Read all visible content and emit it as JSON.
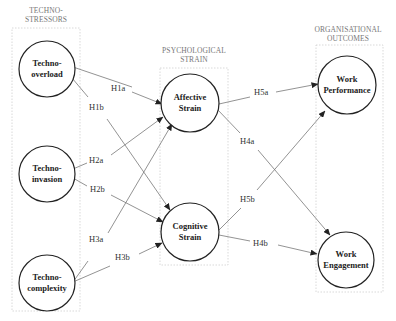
{
  "groups": [
    {
      "id": "stressors",
      "label_line1": "TECHNO-",
      "label_line2": "STRESSORS"
    },
    {
      "id": "strain",
      "label_line1": "PSYCHOLOGICAL",
      "label_line2": "STRAIN"
    },
    {
      "id": "outcomes",
      "label_line1": "ORGANISATIONAL",
      "label_line2": "OUTCOMES"
    }
  ],
  "nodes": [
    {
      "id": "overload",
      "line1": "Techno-",
      "line2": "overload"
    },
    {
      "id": "invasion",
      "line1": "Techno-",
      "line2": "invasion"
    },
    {
      "id": "complexity",
      "line1": "Techno-",
      "line2": "complexity"
    },
    {
      "id": "affective",
      "line1": "Affective",
      "line2": "Strain"
    },
    {
      "id": "cognitive",
      "line1": "Cognitive",
      "line2": "Strain"
    },
    {
      "id": "performance",
      "line1": "Work",
      "line2": "Performance"
    },
    {
      "id": "engagement",
      "line1": "Work",
      "line2": "Engagement"
    }
  ],
  "edges": [
    {
      "label": "H1a",
      "from": "Techno-overload",
      "to": "Affective Strain"
    },
    {
      "label": "H1b",
      "from": "Techno-overload",
      "to": "Cognitive Strain"
    },
    {
      "label": "H2a",
      "from": "Techno-invasion",
      "to": "Affective Strain"
    },
    {
      "label": "H2b",
      "from": "Techno-invasion",
      "to": "Cognitive Strain"
    },
    {
      "label": "H3a",
      "from": "Techno-complexity",
      "to": "Affective Strain"
    },
    {
      "label": "H3b",
      "from": "Techno-complexity",
      "to": "Cognitive Strain"
    },
    {
      "label": "H4a",
      "from": "Affective Strain",
      "to": "Work Engagement"
    },
    {
      "label": "H4b",
      "from": "Cognitive Strain",
      "to": "Work Engagement"
    },
    {
      "label": "H5a",
      "from": "Affective Strain",
      "to": "Work Performance"
    },
    {
      "label": "H5b",
      "from": "Cognitive Strain",
      "to": "Work Performance"
    }
  ]
}
